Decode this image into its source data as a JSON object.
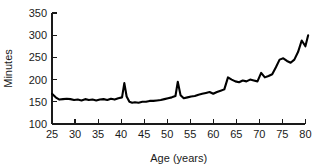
{
  "chart_data": {
    "type": "line",
    "title": "",
    "xlabel": "Age (years)",
    "ylabel": "Minutes",
    "xlim": [
      25,
      81
    ],
    "ylim": [
      100,
      350
    ],
    "grid": false,
    "legend": "none",
    "xticks": [
      25,
      30,
      35,
      40,
      45,
      50,
      55,
      60,
      65,
      70,
      75,
      80
    ],
    "yticks": [
      100,
      150,
      200,
      250,
      300,
      350
    ],
    "line_color": "#000000",
    "series": [
      {
        "name": "Minutes",
        "x": [
          25.0,
          25.8,
          26.6,
          27.4,
          28.2,
          29.0,
          29.8,
          30.6,
          31.4,
          32.2,
          33.0,
          33.8,
          34.6,
          35.4,
          36.2,
          37.0,
          37.8,
          38.6,
          39.4,
          40.2,
          40.7,
          41.2,
          41.8,
          42.4,
          43.0,
          43.8,
          44.6,
          45.4,
          46.2,
          47.0,
          47.8,
          48.6,
          49.4,
          50.2,
          51.0,
          51.8,
          52.3,
          52.9,
          53.6,
          54.4,
          55.2,
          56.0,
          56.8,
          57.6,
          58.4,
          59.2,
          60.0,
          60.8,
          61.6,
          62.4,
          63.2,
          64.0,
          64.8,
          65.6,
          66.4,
          67.2,
          68.0,
          68.8,
          69.6,
          70.4,
          71.2,
          72.0,
          72.8,
          73.6,
          74.4,
          75.2,
          76.0,
          76.8,
          77.6,
          78.4,
          79.2,
          80.0,
          80.6
        ],
        "values": [
          168,
          160,
          155,
          156,
          157,
          156,
          154,
          155,
          153,
          156,
          154,
          155,
          153,
          155,
          156,
          154,
          157,
          155,
          158,
          160,
          192,
          162,
          150,
          148,
          149,
          148,
          150,
          150,
          152,
          152,
          153,
          154,
          156,
          158,
          160,
          163,
          195,
          165,
          158,
          160,
          162,
          163,
          166,
          168,
          170,
          172,
          168,
          172,
          175,
          178,
          205,
          200,
          196,
          194,
          198,
          196,
          200,
          198,
          196,
          215,
          205,
          208,
          212,
          228,
          245,
          248,
          242,
          238,
          245,
          262,
          288,
          275,
          300
        ]
      }
    ]
  },
  "axes": {
    "y_axis_title": "Minutes",
    "x_axis_title": "Age (years)"
  }
}
